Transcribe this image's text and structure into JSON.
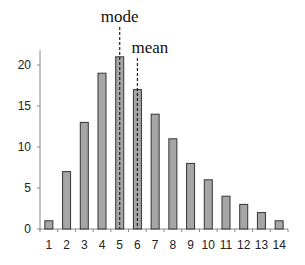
{
  "chart_data": {
    "type": "bar",
    "title": "",
    "xlabel": "",
    "ylabel": "",
    "categories": [
      "1",
      "2",
      "3",
      "4",
      "5",
      "6",
      "7",
      "8",
      "9",
      "10",
      "11",
      "12",
      "13",
      "14"
    ],
    "values": [
      1,
      7,
      13,
      19,
      21,
      17,
      14,
      11,
      8,
      6,
      4,
      3,
      2,
      1
    ],
    "ylim": [
      0,
      22
    ],
    "yticks": [
      0,
      5,
      10,
      15,
      20
    ],
    "grid": false,
    "legend": null,
    "annotations": [
      {
        "label": "mode",
        "category": "5",
        "style": "dashed-vertical-line"
      },
      {
        "label": "mean",
        "category": "6",
        "style": "dashed-vertical-line"
      }
    ]
  },
  "colors": {
    "bar_fill": "#a6a6a6",
    "bar_stroke": "#333333",
    "axis": "#888888",
    "annotation_line": "#222222"
  }
}
